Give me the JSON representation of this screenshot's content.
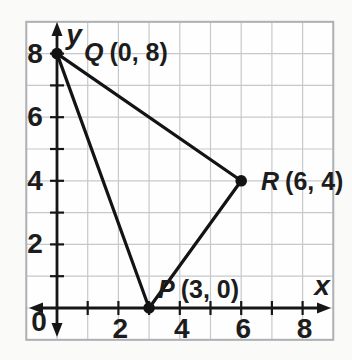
{
  "figure": {
    "background": "#fafaf8",
    "grid_fill": "#fefefe",
    "grid_line_color": "#c6c8cb",
    "grid_border_color": "#aeb1b5",
    "axis_color": "#161616",
    "shape_color": "#131313",
    "text_color": "#1c1c1c"
  },
  "chart_data": {
    "type": "scatter",
    "title": "",
    "xlabel": "x",
    "ylabel": "y",
    "origin_label": "0",
    "xlim": [
      -1,
      9
    ],
    "ylim": [
      -1,
      9
    ],
    "grid": true,
    "tick_step": 1,
    "x_tick_labels": [
      {
        "value": 2,
        "text": "2"
      },
      {
        "value": 4,
        "text": "4"
      },
      {
        "value": 6,
        "text": "6"
      },
      {
        "value": 8,
        "text": "8"
      }
    ],
    "y_tick_labels": [
      {
        "value": 8,
        "text": "8"
      },
      {
        "value": 6,
        "text": "6"
      },
      {
        "value": 4,
        "text": "4"
      },
      {
        "value": 2,
        "text": "2"
      }
    ],
    "points": [
      {
        "name": "Q",
        "x": 0,
        "y": 8,
        "coords_text": "(0, 8)",
        "label_text": "Q (0, 8)",
        "label_px": [
          84,
          61
        ]
      },
      {
        "name": "R",
        "x": 6,
        "y": 4,
        "coords_text": "(6, 4)",
        "label_text": "R (6, 4)",
        "label_px": [
          261,
          190
        ]
      },
      {
        "name": "P",
        "x": 3,
        "y": 0,
        "coords_text": "(3, 0)",
        "label_text": "P (3, 0)",
        "label_px": [
          158,
          298
        ]
      }
    ],
    "segments": [
      [
        "Q",
        "R"
      ],
      [
        "R",
        "P"
      ],
      [
        "P",
        "Q"
      ]
    ]
  }
}
